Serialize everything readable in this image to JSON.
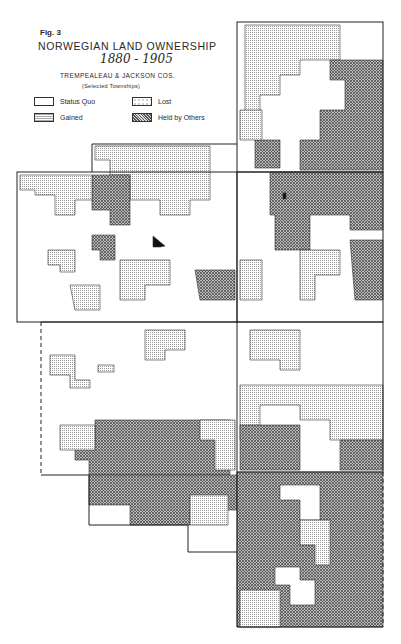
{
  "figure": {
    "label": "Fig. 3",
    "title": "NORWEGIAN LAND OWNERSHIP",
    "years": "1880 - 1905",
    "region": "TREMPEALEAU & JACKSON COS.",
    "note": "(Selected Townships)"
  },
  "legend": {
    "items": [
      {
        "key": "status_quo",
        "label": "Status Quo",
        "pattern": "blank"
      },
      {
        "key": "lost",
        "label": "Lost",
        "pattern": "sparse-dots"
      },
      {
        "key": "gained",
        "label": "Gained",
        "pattern": "fine-grid"
      },
      {
        "key": "held_by_others",
        "label": "Held by Others",
        "pattern": "crosshatch"
      }
    ]
  },
  "map": {
    "townships": [
      {
        "id": "NE-upper",
        "x": 237,
        "y": 22,
        "w": 146,
        "h": 150
      },
      {
        "id": "NE-lower",
        "x": 237,
        "y": 172,
        "w": 146,
        "h": 150
      },
      {
        "id": "N-center",
        "x": 92,
        "y": 144,
        "w": 145,
        "h": 48
      },
      {
        "id": "W-upper",
        "x": 17,
        "y": 172,
        "w": 220,
        "h": 150
      },
      {
        "id": "SW",
        "x": 41,
        "y": 322,
        "w": 196,
        "h": 153,
        "left_edge": "dashed"
      },
      {
        "id": "S-center",
        "x": 89,
        "y": 475,
        "w": 148,
        "h": 50
      },
      {
        "id": "SE-upper",
        "x": 237,
        "y": 322,
        "w": 146,
        "h": 150
      },
      {
        "id": "SE-lower",
        "x": 237,
        "y": 472,
        "w": 146,
        "h": 155,
        "right_edge": "dashed"
      }
    ],
    "colors": {
      "ink": "#2a2a2a",
      "paper": "#ffffff",
      "gained": "#bdbdbd",
      "held": "#8a8a8a",
      "special": "#111111"
    }
  }
}
